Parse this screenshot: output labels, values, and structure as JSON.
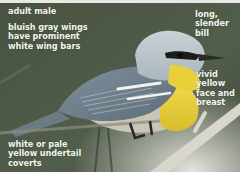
{
  "figure": {
    "colors": {
      "background": "#4a5647",
      "wing_gray": "#8a9aa8",
      "head_gray": "#b7c2c9",
      "yellow": "#e9cf3a",
      "label_text": "#f4f6ee",
      "branch": "#d9d6cc"
    }
  },
  "labels": {
    "age_sex": "adult male",
    "wings": "bluish gray wings\nhave prominent\nwhite wing bars",
    "bill": "long,\nslender\nbill",
    "face": "vivid\nyellow\nface and\nbreast",
    "undertail": "white or pale\nyellow undertail\ncoverts"
  }
}
